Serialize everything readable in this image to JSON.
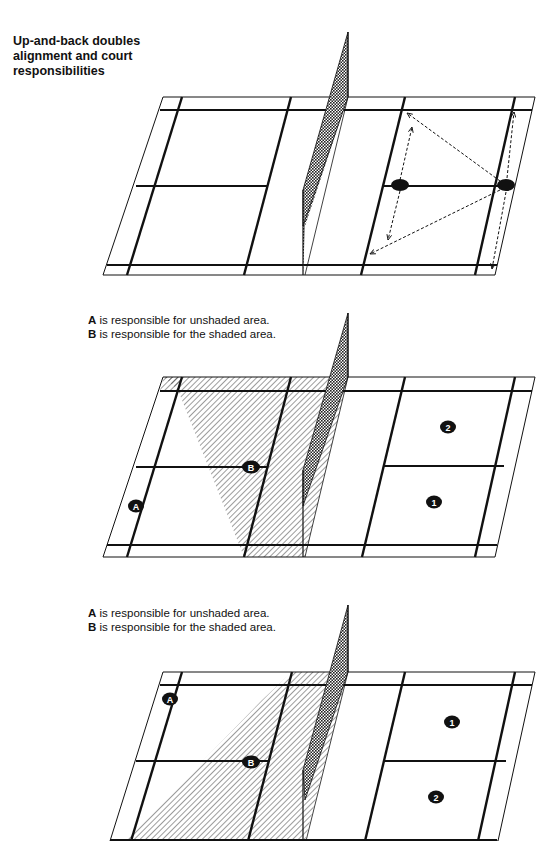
{
  "title": "Up-and-back doubles alignment and court responsibilities",
  "panels": [
    {
      "id": "panel-1",
      "description": "Up-and-back alignment with movement arrows",
      "players": [],
      "arrows": "dashed movement arrows on right half"
    },
    {
      "id": "panel-2",
      "caption": [
        {
          "label": "A",
          "text": " is responsible for unshaded area."
        },
        {
          "label": "B",
          "text": " is responsible for the shaded area."
        }
      ],
      "players": [
        {
          "label": "A",
          "side": "left"
        },
        {
          "label": "B",
          "side": "left"
        },
        {
          "label": "2",
          "side": "right"
        },
        {
          "label": "1",
          "side": "right"
        }
      ]
    },
    {
      "id": "panel-3",
      "caption": [
        {
          "label": "A",
          "text": " is responsible for unshaded area."
        },
        {
          "label": "B",
          "text": " is responsible for the shaded area."
        }
      ],
      "players": [
        {
          "label": "A",
          "side": "left"
        },
        {
          "label": "B",
          "side": "left"
        },
        {
          "label": "1",
          "side": "right"
        },
        {
          "label": "2",
          "side": "right"
        }
      ]
    }
  ],
  "colors": {
    "ink": "#111111",
    "background": "#ffffff"
  }
}
